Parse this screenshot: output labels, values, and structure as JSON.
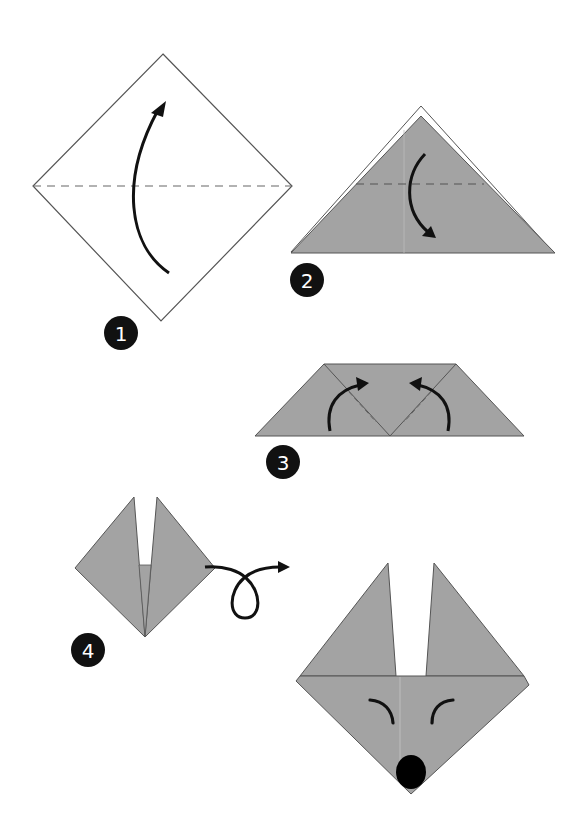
{
  "diagram": {
    "colors": {
      "paper_front": "#ffffff",
      "paper_back": "#a3a3a3",
      "outline": "#555555",
      "arrow": "#111111",
      "badge": "#111111",
      "badge_text": "#ffffff",
      "fold_line": "#666666"
    },
    "steps": [
      {
        "number": "1",
        "description": "Fold the square in half along the diagonal (valley fold upward)"
      },
      {
        "number": "2",
        "description": "Fold the top corner down along the dashed line"
      },
      {
        "number": "3",
        "description": "Fold both bottom corners up to form ears"
      },
      {
        "number": "4",
        "description": "Turn the model over"
      }
    ],
    "result": {
      "description": "Finished fox face with eyes and nose"
    }
  }
}
